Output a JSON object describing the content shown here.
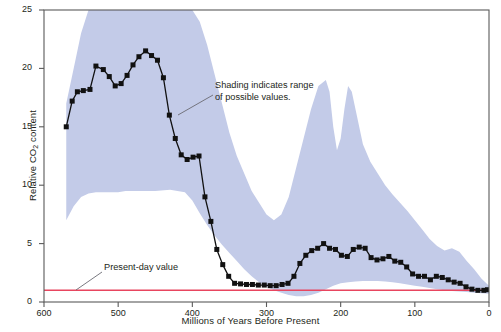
{
  "chart_data": {
    "type": "line",
    "title": "",
    "xlabel": "Millions of Years Before Present",
    "ylabel": "Relative CO2 content",
    "ylabel_text": "Relative CO",
    "ylabel_sub": "2",
    "ylabel_tail": " content",
    "xlim": [
      600,
      0
    ],
    "ylim": [
      0,
      25
    ],
    "x_inverted": true,
    "grid": false,
    "legend": "none",
    "xticks": [
      600,
      500,
      400,
      300,
      200,
      100,
      0
    ],
    "yticks": [
      0,
      5,
      10,
      15,
      20,
      25
    ],
    "series": [
      {
        "name": "Relative CO2 content (best estimate)",
        "marker": "square",
        "color": "#111111",
        "x": [
          570,
          562,
          555,
          547,
          538,
          530,
          520,
          512,
          504,
          496,
          488,
          480,
          472,
          463,
          455,
          447,
          439,
          431,
          423,
          415,
          407,
          399,
          391,
          383,
          375,
          367,
          359,
          351,
          343,
          335,
          327,
          319,
          311,
          303,
          295,
          287,
          279,
          271,
          263,
          255,
          247,
          239,
          231,
          223,
          215,
          207,
          199,
          191,
          183,
          175,
          167,
          159,
          151,
          143,
          135,
          127,
          119,
          111,
          103,
          95,
          87,
          79,
          71,
          63,
          55,
          47,
          39,
          31,
          23,
          15,
          7,
          2
        ],
        "y": [
          15.0,
          17.2,
          18.0,
          18.1,
          18.2,
          20.2,
          19.9,
          19.3,
          18.5,
          18.7,
          19.4,
          20.3,
          21.0,
          21.5,
          21.1,
          20.7,
          19.2,
          16.0,
          14.0,
          12.6,
          12.2,
          12.4,
          12.5,
          9.0,
          6.9,
          4.5,
          3.2,
          2.2,
          1.6,
          1.55,
          1.5,
          1.5,
          1.45,
          1.45,
          1.4,
          1.4,
          1.5,
          1.6,
          2.2,
          3.3,
          4.0,
          4.4,
          4.6,
          5.0,
          4.6,
          4.5,
          4.0,
          3.9,
          4.5,
          4.7,
          4.6,
          3.8,
          3.6,
          3.7,
          3.9,
          3.5,
          3.4,
          3.0,
          2.4,
          2.2,
          2.2,
          1.9,
          2.2,
          2.1,
          1.9,
          1.7,
          1.6,
          1.3,
          1.1,
          1.0,
          1.0,
          1.05
        ]
      }
    ],
    "band": {
      "name": "Range of possible values",
      "color": "#c3cbe8",
      "upper_x": [
        570,
        560,
        550,
        540,
        530,
        520,
        500,
        470,
        440,
        420,
        400,
        390,
        380,
        370,
        360,
        350,
        340,
        330,
        320,
        310,
        300,
        290,
        280,
        270,
        260,
        250,
        240,
        230,
        220,
        215,
        210,
        205,
        200,
        195,
        190,
        185,
        180,
        175,
        170,
        160,
        150,
        140,
        130,
        120,
        110,
        100,
        90,
        80,
        70,
        60,
        50,
        40,
        30,
        20,
        10,
        0
      ],
      "upper_y": [
        17.0,
        20.0,
        23.0,
        25.0,
        25.0,
        25.0,
        25.0,
        25.0,
        25.0,
        25.0,
        25.0,
        24.0,
        22.0,
        19.5,
        17.0,
        14.5,
        12.5,
        11.0,
        9.5,
        8.5,
        7.5,
        7.0,
        7.5,
        9.0,
        11.5,
        14.0,
        16.5,
        18.5,
        19.0,
        18.0,
        15.0,
        13.0,
        14.0,
        16.5,
        18.5,
        18.0,
        16.5,
        15.0,
        13.5,
        12.0,
        11.0,
        10.0,
        9.2,
        8.5,
        7.8,
        7.0,
        6.2,
        5.4,
        4.8,
        4.4,
        4.6,
        4.3,
        3.5,
        2.8,
        2.0,
        1.4
      ],
      "lower_x": [
        570,
        560,
        550,
        540,
        530,
        520,
        510,
        500,
        490,
        470,
        450,
        430,
        410,
        400,
        390,
        380,
        370,
        360,
        350,
        340,
        330,
        320,
        310,
        300,
        290,
        280,
        270,
        260,
        250,
        240,
        230,
        220,
        210,
        200,
        190,
        180,
        170,
        160,
        150,
        140,
        130,
        120,
        110,
        100,
        90,
        80,
        70,
        60,
        50,
        40,
        30,
        20,
        10,
        0
      ],
      "lower_y": [
        7.0,
        8.2,
        9.0,
        9.3,
        9.4,
        9.4,
        9.4,
        9.4,
        9.5,
        9.5,
        9.5,
        9.6,
        9.4,
        8.7,
        7.6,
        6.6,
        5.7,
        4.9,
        4.2,
        3.5,
        2.8,
        2.2,
        1.7,
        1.3,
        1.0,
        0.8,
        0.6,
        0.5,
        0.5,
        0.6,
        0.8,
        1.1,
        1.4,
        1.6,
        1.7,
        1.75,
        1.8,
        1.8,
        1.8,
        1.75,
        1.7,
        1.6,
        1.5,
        1.4,
        1.3,
        1.2,
        1.1,
        1.0,
        0.95,
        0.9,
        0.85,
        0.8,
        0.75,
        0.7
      ]
    },
    "reference_line": {
      "name": "Present-day value",
      "value": 1.0,
      "color": "#e8455f"
    },
    "annotations": [
      {
        "id": "shading",
        "text": "Shading indicates range\nof possible values.",
        "leader_from": [
          213,
          95
        ],
        "leader_to": [
          178,
          115
        ]
      },
      {
        "id": "present-day",
        "text": "Present-day value",
        "leader_from": [
          102,
          272
        ],
        "leader_to": [
          76,
          290
        ]
      }
    ]
  },
  "axes": {
    "y_title_main": "Relative CO",
    "y_title_sub": "2",
    "y_title_tail": " content",
    "x_title": "Millions of Years Before Present"
  },
  "colors": {
    "band": "#c3cbe8",
    "line": "#111111",
    "reference": "#e8455f",
    "axis": "#4a4a4a",
    "text": "#231f20",
    "background": "#ffffff"
  }
}
